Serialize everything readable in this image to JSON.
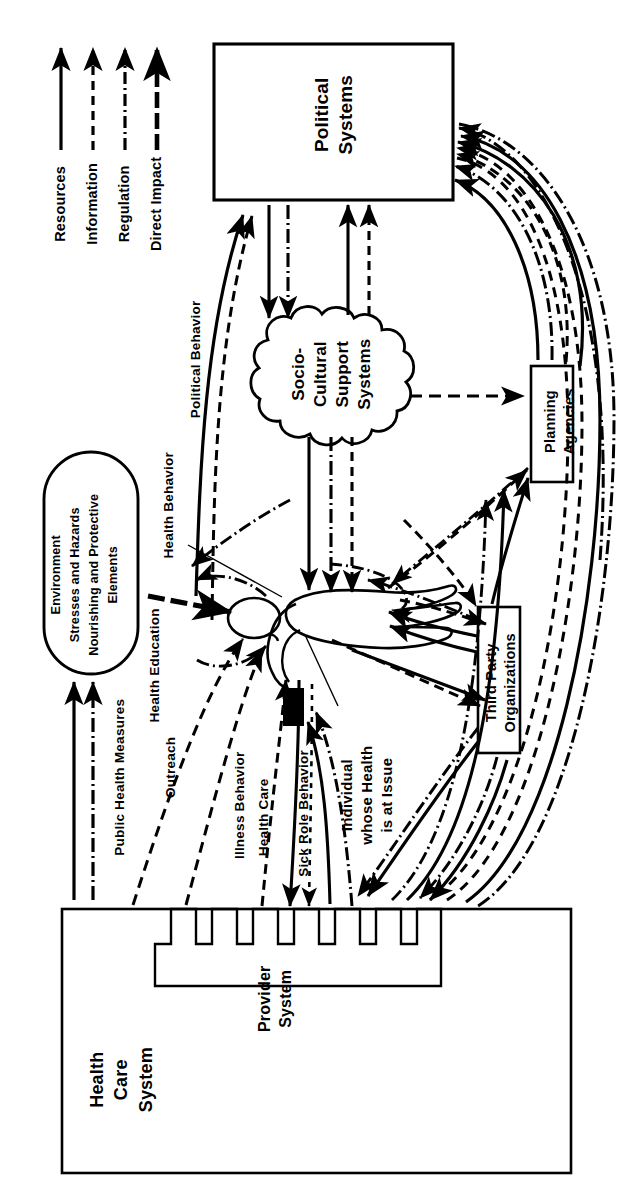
{
  "diagram": {
    "orientation": "rotated-90-counterclockwise",
    "stroke_color": "#000000",
    "background_color": "#FFFFFF"
  },
  "legend": {
    "items": [
      {
        "label": "Resources",
        "style": "solid",
        "arrow": true
      },
      {
        "label": "Information",
        "style": "dashed",
        "arrow": true
      },
      {
        "label": "Regulation",
        "style": "dash-dot",
        "arrow": true
      },
      {
        "label": "Direct Impact",
        "style": "thick-dashed",
        "arrow": true
      }
    ]
  },
  "nodes": {
    "political_systems": {
      "label": "Political\nSystems",
      "shape": "rectangle"
    },
    "socio_cultural": {
      "label": "Socio-\nCultural\nSupport\nSystems",
      "shape": "cloud"
    },
    "environment": {
      "label": "Environment\nStresses and Hazards\nNourishing and Protective\nElements",
      "shape": "stadium"
    },
    "planning_agencies": {
      "label": "Planning\nAgencies",
      "shape": "rectangle"
    },
    "third_party": {
      "label": "Third Party\nOrganizations",
      "shape": "rectangle"
    },
    "health_care_system": {
      "label": "Health\nCare\nSystem",
      "shape": "rectangle"
    },
    "provider_system": {
      "label": "Provider\nSystem",
      "shape": "crenellated-rectangle"
    },
    "individual": {
      "label": "Individual\nwhose Health\nis at Issue",
      "shape": "blob-callout"
    }
  },
  "edge_labels": [
    {
      "label": "Political Behavior"
    },
    {
      "label": "Health Behavior"
    },
    {
      "label": "Health Education"
    },
    {
      "label": "Outreach"
    },
    {
      "label": "Illness Behavior"
    },
    {
      "label": "Health Care"
    },
    {
      "label": "Sick Role Behavior"
    },
    {
      "label": "Public Health Measures"
    }
  ]
}
